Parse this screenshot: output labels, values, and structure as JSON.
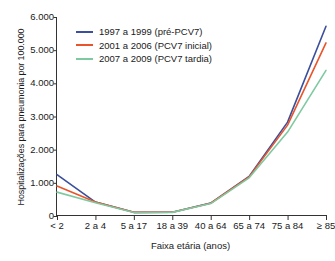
{
  "chart_data": {
    "type": "line",
    "title": "",
    "xlabel": "Faixa etária (anos)",
    "ylabel": "Hospitalizações para pneumonia por 100.000",
    "categories": [
      "< 2",
      "2 a 4",
      "5 a 17",
      "18 a 39",
      "40 a 64",
      "65 a 74",
      "75 a 84",
      "≥ 85"
    ],
    "ylim": [
      0,
      6000
    ],
    "yticks": [
      0,
      1000,
      2000,
      3000,
      4000,
      5000,
      6000
    ],
    "ytick_labels": [
      "0",
      "1.000",
      "2.000",
      "3.000",
      "4.000",
      "5.000",
      "6.000"
    ],
    "grid": false,
    "legend_position": "upper-left-inside",
    "series": [
      {
        "name": "1997 a 1999 (pré-PCV7)",
        "color": "#3b4f9c",
        "values": [
          1250,
          420,
          110,
          115,
          390,
          1190,
          2830,
          5720
        ]
      },
      {
        "name": "2001 a 2006 (PCV7 inicial)",
        "color": "#e8552c",
        "values": [
          905,
          420,
          110,
          115,
          385,
          1180,
          2740,
          5220
        ]
      },
      {
        "name": "2007 a 2009 (PCV7 tardia)",
        "color": "#7fc9a0",
        "values": [
          720,
          400,
          105,
          110,
          375,
          1150,
          2530,
          4390
        ]
      }
    ]
  },
  "axes": {
    "y_title": "Hospitalizações para pneumonia por 100.000",
    "x_title": "Faixa etária (anos)"
  },
  "legend": {
    "items": [
      {
        "label": "1997 a 1999 (pré-PCV7)",
        "color": "#3b4f9c"
      },
      {
        "label": "2001 a 2006 (PCV7 inicial)",
        "color": "#e8552c"
      },
      {
        "label": "2007 a 2009 (PCV7 tardia)",
        "color": "#7fc9a0"
      }
    ]
  }
}
